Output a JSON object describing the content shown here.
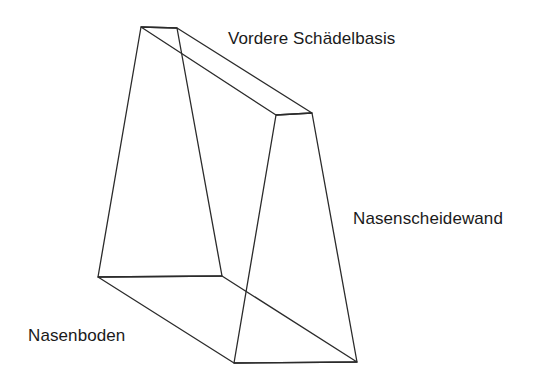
{
  "figure": {
    "background_color": "#ffffff",
    "stroke_color": "#2b2b2b",
    "stroke_width": 1.3,
    "fill": "none",
    "width": 551,
    "height": 386,
    "vertices": {
      "apex_top_left": [
        141,
        27
      ],
      "apex_top_right": [
        177,
        28
      ],
      "top_face_front_right": [
        276,
        115
      ],
      "top_face_back_right": [
        312,
        113
      ],
      "front_bottom_left": [
        98,
        277
      ],
      "front_bottom_right": [
        222,
        276
      ],
      "floor_bottom_front": [
        234,
        363
      ],
      "floor_bottom_right": [
        357,
        362
      ]
    },
    "faces": [
      {
        "name": "front-left-face",
        "label_key": "nasenboden_face",
        "points": "141,27 177,28 222,276 98,277"
      },
      {
        "name": "top-roof-face",
        "label_key": "vordere_schaedelbasis",
        "points": "141,27 177,28 312,113 276,115"
      },
      {
        "name": "right-side-face",
        "label_key": "nasenscheidewand",
        "points": "276,115 312,113 357,362 234,363"
      },
      {
        "name": "floor-face",
        "label_key": "nasenboden",
        "points": "98,277 222,276 357,362 234,363"
      }
    ],
    "edges": [
      {
        "name": "top-short-edge",
        "x1": 141,
        "y1": 27,
        "x2": 177,
        "y2": 28
      },
      {
        "name": "front-left-vertical-edge",
        "x1": 141,
        "y1": 27,
        "x2": 98,
        "y2": 277
      },
      {
        "name": "front-right-vertical-edge",
        "x1": 177,
        "y1": 28,
        "x2": 222,
        "y2": 276
      },
      {
        "name": "front-bottom-edge",
        "x1": 98,
        "y1": 277,
        "x2": 222,
        "y2": 276
      },
      {
        "name": "roof-front-diagonal",
        "x1": 141,
        "y1": 27,
        "x2": 276,
        "y2": 115
      },
      {
        "name": "roof-back-diagonal",
        "x1": 177,
        "y1": 28,
        "x2": 312,
        "y2": 113
      },
      {
        "name": "roof-right-short-edge",
        "x1": 276,
        "y1": 115,
        "x2": 312,
        "y2": 113
      },
      {
        "name": "right-face-front-edge",
        "x1": 276,
        "y1": 115,
        "x2": 234,
        "y2": 363
      },
      {
        "name": "right-face-back-edge",
        "x1": 312,
        "y1": 113,
        "x2": 357,
        "y2": 362
      },
      {
        "name": "bottom-right-edge",
        "x1": 234,
        "y1": 363,
        "x2": 357,
        "y2": 362
      },
      {
        "name": "floor-left-diagonal",
        "x1": 98,
        "y1": 277,
        "x2": 234,
        "y2": 363
      },
      {
        "name": "floor-right-diagonal",
        "x1": 222,
        "y1": 276,
        "x2": 357,
        "y2": 362
      }
    ]
  },
  "labels": {
    "vordere_schaedelbasis": "Vordere Schädelbasis",
    "nasenscheidewand": "Nasenscheidewand",
    "nasenboden": "Nasenboden"
  }
}
